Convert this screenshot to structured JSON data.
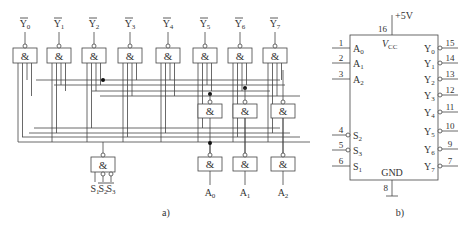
{
  "figure_a": {
    "caption": "a)",
    "gate_symbol": "&",
    "outputs": [
      {
        "base": "Y",
        "sub": "0",
        "overline": true
      },
      {
        "base": "Y",
        "sub": "1",
        "overline": true
      },
      {
        "base": "Y",
        "sub": "2",
        "overline": true
      },
      {
        "base": "Y",
        "sub": "3",
        "overline": true
      },
      {
        "base": "Y",
        "sub": "4",
        "overline": true
      },
      {
        "base": "Y",
        "sub": "5",
        "overline": true
      },
      {
        "base": "Y",
        "sub": "6",
        "overline": true
      },
      {
        "base": "Y",
        "sub": "7",
        "overline": true
      }
    ],
    "address_inputs": [
      {
        "base": "A",
        "sub": "0"
      },
      {
        "base": "A",
        "sub": "1"
      },
      {
        "base": "A",
        "sub": "2"
      }
    ],
    "enable_inputs": [
      {
        "base": "S",
        "sub": "1",
        "overline": false
      },
      {
        "base": "S",
        "sub": "2",
        "overline": true
      },
      {
        "base": "S",
        "sub": "3",
        "overline": true
      }
    ]
  },
  "figure_b": {
    "caption": "b)",
    "supply_label": "+5V",
    "vcc_label": "V",
    "vcc_sub": "CC",
    "gnd_label": "GND",
    "vcc_pin": "16",
    "gnd_pin": "8",
    "left_pins": [
      {
        "pin": "1",
        "base": "A",
        "sub": "0",
        "inverted": false
      },
      {
        "pin": "2",
        "base": "A",
        "sub": "1",
        "inverted": false
      },
      {
        "pin": "3",
        "base": "A",
        "sub": "2",
        "inverted": false
      },
      {
        "pin": "4",
        "base": "S",
        "sub": "2",
        "inverted": true
      },
      {
        "pin": "5",
        "base": "S",
        "sub": "3",
        "inverted": true
      },
      {
        "pin": "6",
        "base": "S",
        "sub": "1",
        "inverted": false
      }
    ],
    "right_pins": [
      {
        "pin": "15",
        "base": "Y",
        "sub": "0"
      },
      {
        "pin": "14",
        "base": "Y",
        "sub": "1"
      },
      {
        "pin": "13",
        "base": "Y",
        "sub": "2"
      },
      {
        "pin": "12",
        "base": "Y",
        "sub": "3"
      },
      {
        "pin": "11",
        "base": "Y",
        "sub": "4"
      },
      {
        "pin": "10",
        "base": "Y",
        "sub": "5"
      },
      {
        "pin": "9",
        "base": "Y",
        "sub": "6"
      },
      {
        "pin": "7",
        "base": "Y",
        "sub": "7"
      }
    ]
  }
}
